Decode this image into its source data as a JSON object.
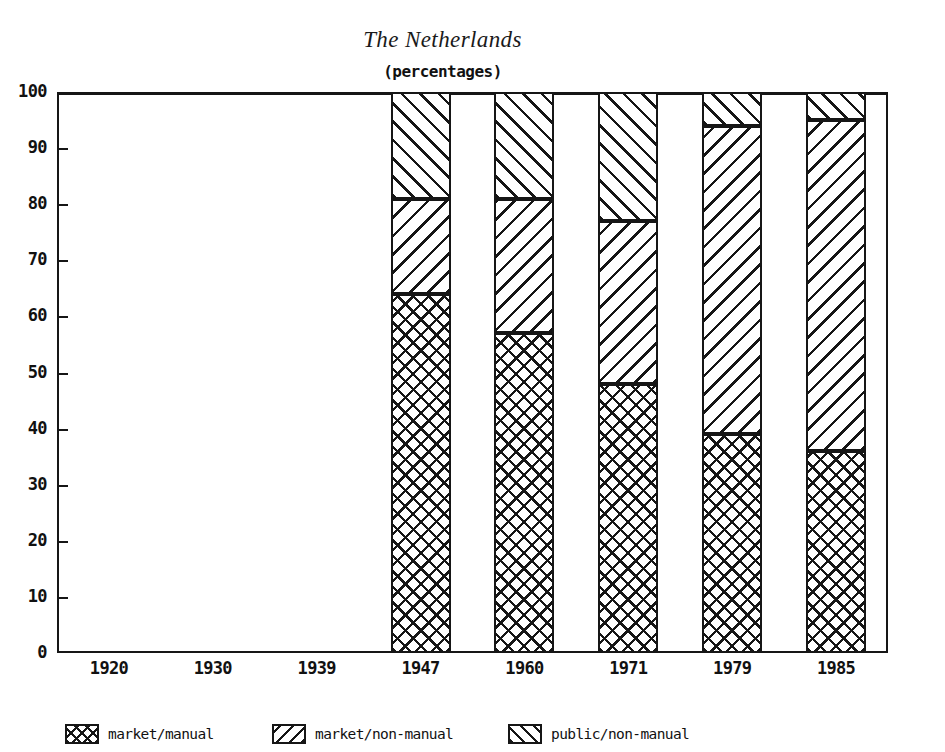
{
  "chart_data": {
    "type": "bar",
    "stacked": true,
    "title": "The Netherlands",
    "subtitle": "(percentages)",
    "xlabel": "",
    "ylabel": "",
    "ylim": [
      0,
      100
    ],
    "ytick_step": 10,
    "yticks": [
      "100",
      "90",
      "80",
      "70",
      "60",
      "50",
      "40",
      "30",
      "20",
      "10",
      "0"
    ],
    "categories": [
      "1920",
      "1930",
      "1939",
      "1947",
      "1960",
      "1971",
      "1979",
      "1985"
    ],
    "grid": false,
    "legend_position": "bottom",
    "series": [
      {
        "name": "market/manual",
        "pattern": "cross-hatch",
        "values": [
          null,
          null,
          null,
          64,
          57,
          48,
          39,
          36
        ]
      },
      {
        "name": "market/non-manual",
        "pattern": "backslash-hatch",
        "values": [
          null,
          null,
          null,
          17,
          24,
          29,
          55,
          38
        ]
      },
      {
        "name": "public/non-manual",
        "pattern": "forwardslash-hatch",
        "values": [
          null,
          null,
          null,
          19,
          19,
          23,
          6,
          26
        ]
      }
    ],
    "cumulative_tops": [
      {
        "category": "1920",
        "tops": []
      },
      {
        "category": "1930",
        "tops": []
      },
      {
        "category": "1939",
        "tops": []
      },
      {
        "category": "1947",
        "tops": [
          64,
          81,
          100
        ]
      },
      {
        "category": "1960",
        "tops": [
          57,
          81,
          100
        ]
      },
      {
        "category": "1971",
        "tops": [
          48,
          77,
          100
        ]
      },
      {
        "category": "1979",
        "tops": [
          39,
          94,
          100
        ]
      },
      {
        "category": "1985",
        "tops": [
          36,
          95,
          100
        ]
      }
    ],
    "colors": {
      "ink": "#161616",
      "background": "#ffffff"
    }
  },
  "legend": {
    "items": [
      {
        "label": "market/manual",
        "pattern": "cross-hatch"
      },
      {
        "label": "market/non-manual",
        "pattern": "backslash-hatch"
      },
      {
        "label": "public/non-manual",
        "pattern": "forwardslash-hatch"
      }
    ]
  }
}
